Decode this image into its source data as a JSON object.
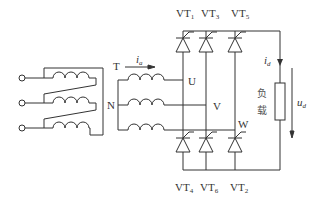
{
  "diagram": {
    "type": "three-phase-bridge-rectifier",
    "colors": {
      "line": "#333333",
      "background": "#ffffff"
    },
    "transformer": {
      "label": "T",
      "neutral_label": "N",
      "phases": [
        "U",
        "V",
        "W"
      ]
    },
    "current_label": {
      "main": "i",
      "sub": "a"
    },
    "thyristors_top": [
      {
        "main": "VT",
        "sub": "1"
      },
      {
        "main": "VT",
        "sub": "3"
      },
      {
        "main": "VT",
        "sub": "5"
      }
    ],
    "thyristors_bottom": [
      {
        "main": "VT",
        "sub": "4"
      },
      {
        "main": "VT",
        "sub": "6"
      },
      {
        "main": "VT",
        "sub": "2"
      }
    ],
    "load": {
      "label_line1": "负",
      "label_line2": "载",
      "current": {
        "main": "i",
        "sub": "d"
      },
      "voltage": {
        "main": "u",
        "sub": "d"
      }
    }
  }
}
